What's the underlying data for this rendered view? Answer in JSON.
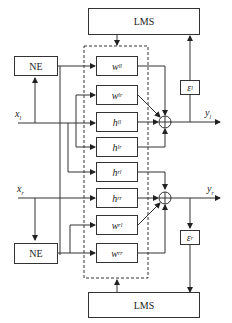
{
  "diagram": {
    "lms_top": "LMS",
    "lms_bottom": "LMS",
    "ne_top": "NE",
    "ne_bottom": "NE",
    "blocks": [
      {
        "base": "w",
        "sub": "ll"
      },
      {
        "base": "w",
        "sub": "lr"
      },
      {
        "base": "h",
        "sub": "ll"
      },
      {
        "base": "h",
        "sub": "lr"
      },
      {
        "base": "h",
        "sub": "rl"
      },
      {
        "base": "h",
        "sub": "rr"
      },
      {
        "base": "w",
        "sub": "rl"
      },
      {
        "base": "w",
        "sub": "rr"
      }
    ],
    "error_top": {
      "base": "ε",
      "sub": "l"
    },
    "error_bottom": {
      "base": "ε",
      "sub": "r"
    },
    "input_top": {
      "base": "x",
      "sub": "l"
    },
    "input_bottom": {
      "base": "x",
      "sub": "r"
    },
    "output_top": {
      "base": "y",
      "sub": "l"
    },
    "output_bottom": {
      "base": "y",
      "sub": "r"
    },
    "sum_symbol": "⊕"
  }
}
